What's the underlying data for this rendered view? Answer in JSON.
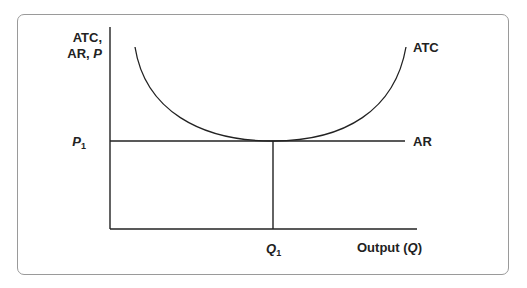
{
  "diagram": {
    "title": "",
    "y_axis_label_line1": "ATC,",
    "y_axis_label_line2_prefix": "AR, ",
    "y_axis_label_line2_var": "P",
    "x_axis_label_prefix": "Output (",
    "x_axis_label_var": "Q",
    "x_axis_label_suffix": ")",
    "price_label": "P",
    "price_subscript": "1",
    "quantity_label": "Q",
    "quantity_subscript": "1",
    "curves": [
      {
        "name": "ATC",
        "label": "ATC",
        "shape": "U-shaped, minimum tangent to AR at Q1"
      },
      {
        "name": "AR",
        "label": "AR",
        "shape": "horizontal at P1"
      }
    ],
    "line_color": "#222222",
    "frame_color": "#9a9a9a"
  }
}
